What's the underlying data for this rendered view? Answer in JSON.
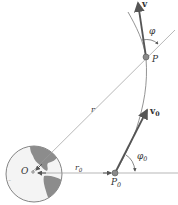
{
  "diagram": {
    "type": "orbital-trajectory",
    "labels": {
      "v": "v",
      "v0_main": "v",
      "v0_sub": "0",
      "phi": "φ",
      "phi0_main": "φ",
      "phi0_sub": "0",
      "P": "P",
      "P0_main": "P",
      "P0_sub": "0",
      "r": "r",
      "r0_main": "r",
      "r0_sub": "0",
      "O": "O"
    },
    "colors": {
      "line": "#9a9a9a",
      "vector": "#555555",
      "point": "#8a8a8a",
      "earth_land": "#8c8c8c",
      "earth_outline": "#666666"
    }
  }
}
